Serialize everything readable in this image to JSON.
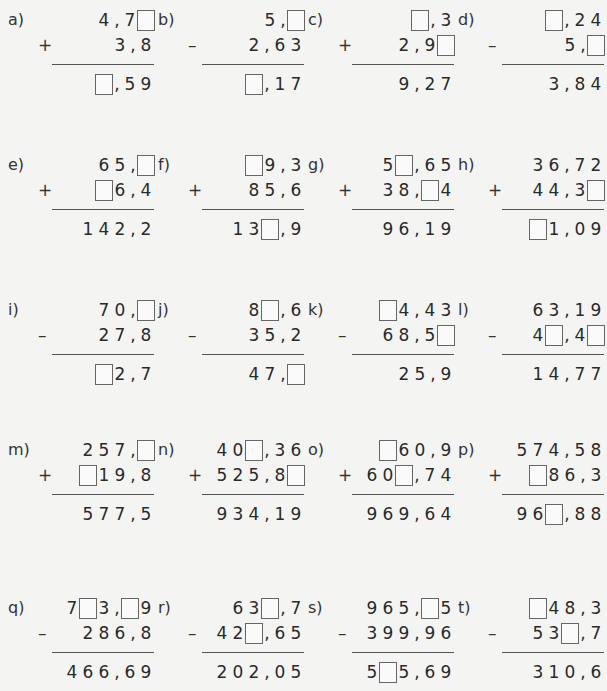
{
  "problems": [
    {
      "label": "a)",
      "op": "+",
      "top": "4,7_",
      "bottom": "3,8",
      "result": "_,59"
    },
    {
      "label": "b)",
      "op": "–",
      "top": "5,_",
      "bottom": "2,63",
      "result": "_,17"
    },
    {
      "label": "c)",
      "op": "+",
      "top": "_,3",
      "bottom": "2,9_",
      "result": "9,27"
    },
    {
      "label": "d)",
      "op": "–",
      "top": "_,24",
      "bottom": "5,_",
      "result": "3,84"
    },
    {
      "label": "e)",
      "op": "+",
      "top": "65,_",
      "bottom": "_6,4",
      "result": "142,2"
    },
    {
      "label": "f)",
      "op": "+",
      "top": "_9,3",
      "bottom": "85,6",
      "result": "13_,9"
    },
    {
      "label": "g)",
      "op": "+",
      "top": "5_,65",
      "bottom": "38,_4",
      "result": "96,19"
    },
    {
      "label": "h)",
      "op": "+",
      "top": "36,72",
      "bottom": "44,3_",
      "result": "_1,09"
    },
    {
      "label": "i)",
      "op": "–",
      "top": "70,_",
      "bottom": "27,8",
      "result": "_2,7"
    },
    {
      "label": "j)",
      "op": "–",
      "top": "8_,6",
      "bottom": "35,2",
      "result": "47,_"
    },
    {
      "label": "k)",
      "op": "–",
      "top": "_4,43",
      "bottom": "68,5_",
      "result": "25,9"
    },
    {
      "label": "l)",
      "op": "–",
      "top": "63,19",
      "bottom": "4_,4_",
      "result": "14,77"
    },
    {
      "label": "m)",
      "op": "+",
      "top": "257,_",
      "bottom": "_19,8",
      "result": "577,5"
    },
    {
      "label": "n)",
      "op": "+",
      "top": "40_,36",
      "bottom": "525,8_",
      "result": "934,19"
    },
    {
      "label": "o)",
      "op": "+",
      "top": "_60,9",
      "bottom": "60_,74",
      "result": "969,64"
    },
    {
      "label": "p)",
      "op": "+",
      "top": "574,58",
      "bottom": "_86,3",
      "result": "96_,88"
    },
    {
      "label": "q)",
      "op": "–",
      "top": "7_3,_9",
      "bottom": "286,8",
      "result": "466,69"
    },
    {
      "label": "r)",
      "op": "–",
      "top": "63_,7",
      "bottom": "42_,65",
      "result": "202,05"
    },
    {
      "label": "s)",
      "op": "–",
      "top": "965,_5",
      "bottom": "399,96",
      "result": "5_5,69"
    },
    {
      "label": "t)",
      "op": "–",
      "top": "_48,3",
      "bottom": "53_,7",
      "result": "310,6"
    }
  ]
}
